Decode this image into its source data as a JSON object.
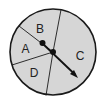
{
  "diagram": {
    "type": "spinner",
    "colors": {
      "fill": "#d6d6d6",
      "stroke": "#1a1a1a",
      "background": "#ffffff"
    },
    "sections": [
      {
        "label": "A"
      },
      {
        "label": "B"
      },
      {
        "label": "C"
      },
      {
        "label": "D"
      }
    ],
    "pointer": {
      "points_to": "C"
    }
  }
}
